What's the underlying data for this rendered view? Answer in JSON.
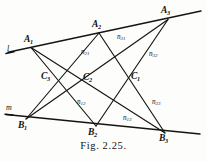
{
  "figure": {
    "caption": "Fig. 2.25.",
    "title": "Fig. 2.25.",
    "type": "pappus-configuration-diagram"
  },
  "lines": {
    "l": {
      "label": "l",
      "name": "line-l-label"
    },
    "m": {
      "label": "m",
      "name": "line-m-label"
    }
  },
  "points": {
    "A1": {
      "label": "A",
      "sub": "1"
    },
    "A2": {
      "label": "A",
      "sub": "2"
    },
    "A3": {
      "label": "A",
      "sub": "3"
    },
    "B1": {
      "label": "B",
      "sub": "1"
    },
    "B2": {
      "label": "B",
      "sub": "2"
    },
    "B3": {
      "label": "B",
      "sub": "3"
    },
    "C1": {
      "label": "C",
      "sub": "1"
    },
    "C2": {
      "label": "C",
      "sub": "2"
    },
    "C3": {
      "label": "C",
      "sub": "3"
    }
  },
  "edge_labels": {
    "n21": {
      "label": "n",
      "sub": "21"
    },
    "n31": {
      "label": "n",
      "sub": "31"
    },
    "n32": {
      "label": "n",
      "sub": "32"
    },
    "n12": {
      "label": "n",
      "sub": "12"
    },
    "n13": {
      "label": "n",
      "sub": "13"
    },
    "n23": {
      "label": "n",
      "sub": "23"
    }
  },
  "colors": {
    "ink": "#141410",
    "paper": "#fdfdfb"
  },
  "geometry": {
    "line_l": {
      "x1": 8,
      "y1": 52,
      "x2": 201,
      "y2": 11
    },
    "line_m": {
      "x1": 6,
      "y1": 115,
      "x2": 200,
      "y2": 134
    },
    "A1": {
      "x": 31,
      "y": 47
    },
    "A2": {
      "x": 99,
      "y": 33
    },
    "A3": {
      "x": 168,
      "y": 19
    },
    "B1": {
      "x": 26,
      "y": 119
    },
    "B2": {
      "x": 96,
      "y": 126
    },
    "B3": {
      "x": 165,
      "y": 133
    },
    "C1": {
      "x": 136,
      "y": 78
    },
    "C2": {
      "x": 87,
      "y": 79
    },
    "C3": {
      "x": 47,
      "y": 78
    }
  }
}
